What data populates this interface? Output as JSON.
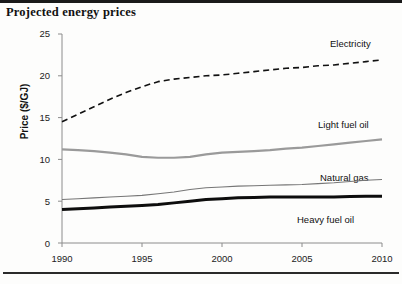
{
  "title": "Projected energy prices",
  "chart_data": {
    "type": "line",
    "title": "Projected energy prices",
    "xlabel": "",
    "ylabel": "Price ($/GJ)",
    "xlim": [
      1990,
      2010
    ],
    "ylim": [
      0,
      25
    ],
    "grid": false,
    "legend_position": "inline-right",
    "x_ticks": [
      "1990",
      "1995",
      "2000",
      "2005",
      "2010"
    ],
    "y_ticks": [
      "0",
      "5",
      "10",
      "15",
      "20",
      "25"
    ],
    "x": [
      1990,
      1991,
      1992,
      1993,
      1994,
      1995,
      1996,
      1997,
      1998,
      1999,
      2000,
      2001,
      2002,
      2003,
      2004,
      2005,
      2006,
      2007,
      2008,
      2009,
      2010
    ],
    "series": [
      {
        "name": "Electricity",
        "style": "dashed",
        "color": "#111111",
        "width": 1.6,
        "values": [
          14.5,
          15.4,
          16.3,
          17.2,
          18.0,
          18.7,
          19.3,
          19.6,
          19.8,
          20.0,
          20.1,
          20.3,
          20.5,
          20.7,
          20.9,
          21.0,
          21.2,
          21.3,
          21.5,
          21.7,
          21.9
        ]
      },
      {
        "name": "Light fuel oil",
        "style": "solid",
        "color": "#9a9a9a",
        "width": 2.2,
        "values": [
          11.2,
          11.1,
          11.0,
          10.8,
          10.6,
          10.3,
          10.2,
          10.2,
          10.3,
          10.6,
          10.8,
          10.9,
          11.0,
          11.1,
          11.3,
          11.4,
          11.6,
          11.8,
          12.0,
          12.2,
          12.4
        ]
      },
      {
        "name": "Natural gas",
        "style": "solid",
        "color": "#767676",
        "width": 1.1,
        "values": [
          5.2,
          5.3,
          5.4,
          5.5,
          5.6,
          5.7,
          5.9,
          6.1,
          6.4,
          6.6,
          6.7,
          6.8,
          6.85,
          6.9,
          6.95,
          7.0,
          7.1,
          7.2,
          7.35,
          7.5,
          7.6
        ]
      },
      {
        "name": "Heavy fuel oil",
        "style": "solid",
        "color": "#0d0d0d",
        "width": 3.0,
        "values": [
          4.0,
          4.1,
          4.2,
          4.3,
          4.4,
          4.5,
          4.6,
          4.8,
          5.0,
          5.2,
          5.3,
          5.4,
          5.45,
          5.5,
          5.5,
          5.5,
          5.5,
          5.5,
          5.55,
          5.6,
          5.6
        ]
      }
    ],
    "annotations": [
      {
        "text": "Electricity",
        "x": 330,
        "y": 16
      },
      {
        "text": "Light fuel oil",
        "x": 318,
        "y": 97
      },
      {
        "text": "Natural gas",
        "x": 320,
        "y": 150
      },
      {
        "text": "Heavy fuel oil",
        "x": 297,
        "y": 192
      }
    ]
  }
}
